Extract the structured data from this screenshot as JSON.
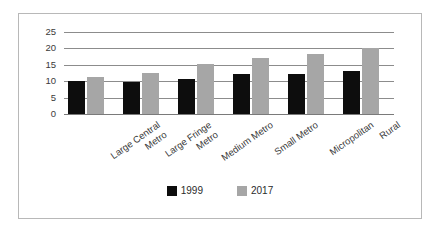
{
  "chart_data": {
    "type": "bar",
    "title": "",
    "subtitle": "",
    "xlabel": "",
    "ylabel": "",
    "ylim": [
      0,
      25
    ],
    "yticks": [
      0,
      5,
      10,
      15,
      20,
      25
    ],
    "ytick_labels": [
      "0",
      "5",
      "10",
      "15",
      "20",
      "25"
    ],
    "grid": true,
    "legend_position": "bottom-center",
    "orientation": "vertical",
    "grouping": "grouped",
    "categories": [
      "Large Central Metro",
      "Large Fringe Metro",
      "Medium Metro",
      "Small Metro",
      "Micropolitan",
      "Rural"
    ],
    "category_label_lines": [
      [
        "Large Central",
        "Metro"
      ],
      [
        "Large Fringe",
        "Metro"
      ],
      [
        "Medium Metro"
      ],
      [
        "Small Metro"
      ],
      [
        "Micropolitan"
      ],
      [
        "Rural"
      ]
    ],
    "series": [
      {
        "name": "1999",
        "color": "#0d0d0d",
        "values": [
          10.0,
          9.7,
          10.8,
          12.3,
          12.3,
          13.1
        ]
      },
      {
        "name": "2017",
        "color": "#a6a6a6",
        "values": [
          11.3,
          12.5,
          15.2,
          17.1,
          18.3,
          20.0
        ]
      }
    ],
    "legend": [
      {
        "label": "1999",
        "color": "#0d0d0d"
      },
      {
        "label": "2017",
        "color": "#a6a6a6"
      }
    ],
    "colors": {
      "border": "#b8b8b8",
      "gridline": "#8c8c8c",
      "axis": "#7a7a7a",
      "text": "#3a3a3a",
      "background": "#ffffff"
    }
  }
}
